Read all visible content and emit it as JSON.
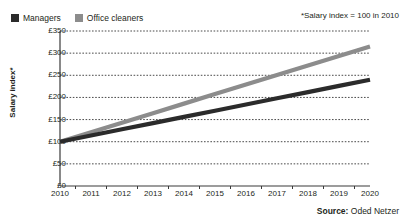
{
  "legend": {
    "entries": [
      {
        "label": "Managers",
        "color": "#2b2b2b",
        "swatch_icon": "square-swatch-icon"
      },
      {
        "label": "Office cleaners",
        "color": "#8c8c8c",
        "swatch_icon": "square-swatch-icon"
      }
    ]
  },
  "note": "*Salary index = 100 in 2010",
  "source": {
    "label": "Source:",
    "value": "Oded Netzer"
  },
  "axis": {
    "y_title": "Salary index*"
  },
  "chart_data": {
    "type": "line",
    "title": "",
    "subtitle": "",
    "xlabel": "",
    "ylabel": "Salary index*",
    "annotations": [
      "*Salary index = 100 in 2010"
    ],
    "categories": [
      "2010",
      "2011",
      "2012",
      "2013",
      "2014",
      "2015",
      "2016",
      "2017",
      "2018",
      "2019",
      "2020"
    ],
    "x": [
      2010,
      2011,
      2012,
      2013,
      2014,
      2015,
      2016,
      2017,
      2018,
      2019,
      2020
    ],
    "xlim": [
      2010,
      2020
    ],
    "ylim": [
      0,
      350
    ],
    "y_ticks": [
      0,
      50,
      100,
      150,
      200,
      250,
      300,
      350
    ],
    "y_tick_labels": [
      "£0",
      "£50",
      "£100",
      "£150",
      "£200",
      "£250",
      "£300",
      "£350"
    ],
    "grid": true,
    "grid_style": "dotted-horizontal",
    "legend_position": "top-left",
    "series": [
      {
        "name": "Managers",
        "color": "#2b2b2b",
        "values": [
          100,
          114,
          128,
          142,
          156,
          170,
          184,
          198,
          212,
          226,
          240
        ]
      },
      {
        "name": "Office cleaners",
        "color": "#8c8c8c",
        "values": [
          100,
          121.5,
          143,
          164.5,
          186,
          207.5,
          229,
          250.5,
          272,
          293.5,
          315
        ]
      }
    ]
  },
  "colors": {
    "managers": "#2b2b2b",
    "office_cleaners": "#8c8c8c",
    "axis": "#3a3a3a",
    "grid": "#4a4a4a",
    "text": "#231f20",
    "background": "#ffffff"
  }
}
